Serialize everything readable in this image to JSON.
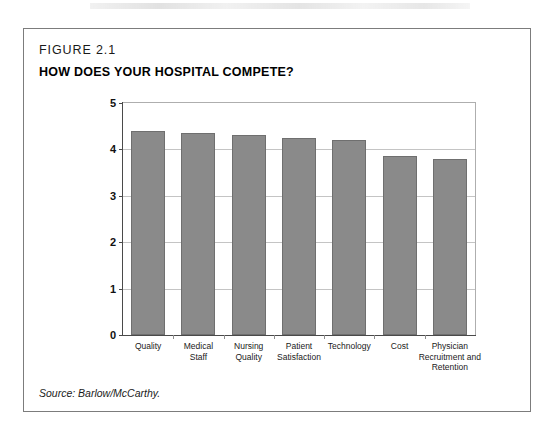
{
  "figure": {
    "number": "FIGURE 2.1",
    "title": "HOW DOES YOUR HOSPITAL COMPETE?",
    "source": "Source: Barlow/McCarthy."
  },
  "colors": {
    "bar_fill": "#8a8a8a",
    "bar_stroke": "#6f6f6f",
    "grid": "#c4c4c4",
    "axis": "#4a4a4a",
    "frame": "#7c7c7c",
    "text": "#1a1a1a"
  },
  "chart_data": {
    "type": "bar",
    "title": "HOW DOES YOUR HOSPITAL COMPETE?",
    "xlabel": "",
    "ylabel": "",
    "ylim": [
      0,
      5
    ],
    "yticks": [
      "0",
      "1",
      "2",
      "3",
      "4",
      "5"
    ],
    "grid": true,
    "legend": "none",
    "categories": [
      "Quality",
      "Medical Staff",
      "Nursing Quality",
      "Patient Satisfaction",
      "Technology",
      "Cost",
      "Physician Recruitment and Retention"
    ],
    "category_lines": [
      [
        "Quality"
      ],
      [
        "Medical",
        "Staff"
      ],
      [
        "Nursing",
        "Quality"
      ],
      [
        "Patient",
        "Satisfaction"
      ],
      [
        "Technology"
      ],
      [
        "Cost"
      ],
      [
        "Physician",
        "Recruitment and",
        "Retention"
      ]
    ],
    "values": [
      4.4,
      4.35,
      4.3,
      4.25,
      4.2,
      3.85,
      3.8
    ]
  }
}
